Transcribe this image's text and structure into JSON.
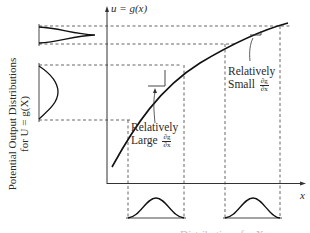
{
  "figure": {
    "y_axis_label": "u = g(x)",
    "x_axis_label": "x",
    "left_caption": {
      "line1": "Potential Output Distributions",
      "line2": "for U = g(X)"
    },
    "annotations": [
      {
        "line1": "Relatively",
        "line2": "Large",
        "frac_num": "∂g",
        "frac_den": "∂x"
      },
      {
        "line1": "Relatively",
        "line2": "Small",
        "frac_num": "∂g",
        "frac_den": "∂x"
      }
    ],
    "bottom_caption_partial": "Distributions for X"
  }
}
